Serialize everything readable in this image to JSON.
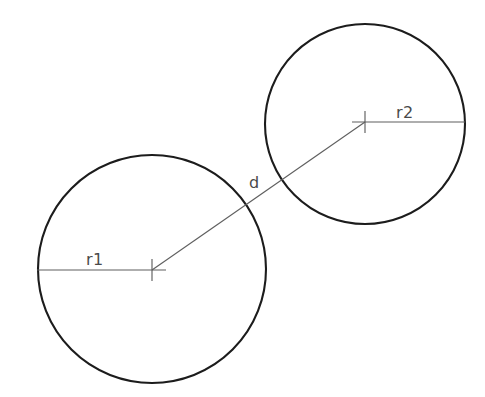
{
  "diagram": {
    "background_color": "#ffffff",
    "outline_color": "#1c1c1c",
    "dimension_color": "#5f5f5f",
    "label_color": "#4a4a4a",
    "circles": [
      {
        "id": "circle-1",
        "name": "left-circle",
        "cx": 152,
        "cy": 269,
        "r": 114,
        "radius_label": "r1",
        "radius_label_x": 86,
        "radius_label_y": 265,
        "radius_line": {
          "x1": 37,
          "y1": 270,
          "x2": 166,
          "y2": 270
        }
      },
      {
        "id": "circle-2",
        "name": "right-circle",
        "cx": 365,
        "cy": 124,
        "r": 100,
        "radius_label": "r2",
        "radius_label_x": 396,
        "radius_label_y": 118,
        "radius_line": {
          "x1": 352,
          "y1": 122,
          "x2": 465,
          "y2": 122
        }
      }
    ],
    "distance": {
      "label": "d",
      "label_x": 249,
      "label_y": 188,
      "line": {
        "x1": 152,
        "y1": 270,
        "x2": 365,
        "y2": 122
      }
    },
    "center_marks": [
      {
        "name": "center-mark-1",
        "cx": 152,
        "cy": 270,
        "arm": 11
      },
      {
        "name": "center-mark-2",
        "cx": 365,
        "cy": 122,
        "arm": 11
      }
    ]
  }
}
